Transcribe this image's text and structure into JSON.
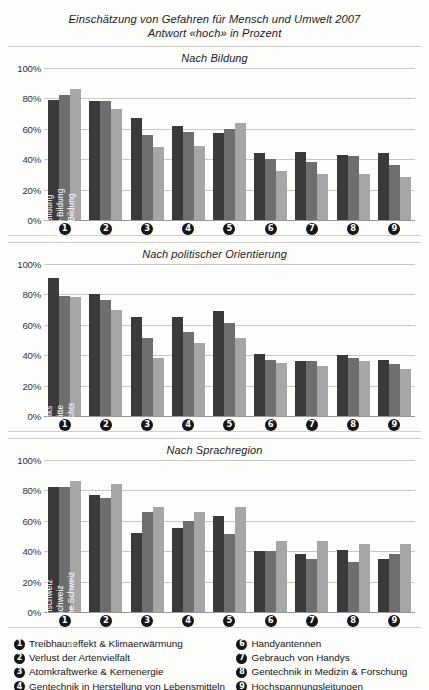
{
  "header": {
    "title_line1": "Einschätzung von Gefahren für Mensch und Umwelt 2007",
    "title_line2": "Antwort «hoch» in Prozent"
  },
  "axis": {
    "ticks": [
      "100%",
      "80%",
      "60%",
      "40%",
      "20%",
      "0%"
    ],
    "categories": [
      "1",
      "2",
      "3",
      "4",
      "5",
      "6",
      "7",
      "8",
      "9"
    ]
  },
  "colors": {
    "series1": "#3a3a3a",
    "series2": "#6e6e6e",
    "series3": "#a6a6a6",
    "grid": "#c9c7c3",
    "background": "#fdfdfc"
  },
  "footnotes": {
    "left": [
      {
        "num": "1",
        "text": "Treibhauseffekt & Klimaerwärmung"
      },
      {
        "num": "2",
        "text": "Verlust der Artenvielfalt"
      },
      {
        "num": "3",
        "text": "Atomkraftwerke & Kernenergie"
      },
      {
        "num": "4",
        "text": "Gentechnik in Herstellung von Lebensmitteln"
      },
      {
        "num": "5",
        "text": "Umweltbelastung & Unfälle durch Autoverkehr"
      }
    ],
    "right": [
      {
        "num": "6",
        "text": "Handyantennen"
      },
      {
        "num": "7",
        "text": "Gebrauch von Handys"
      },
      {
        "num": "8",
        "text": "Gentechnik in Medizin & Forschung"
      },
      {
        "num": "9",
        "text": "Hochspannungsleitungen"
      }
    ]
  },
  "chart_data": [
    {
      "type": "bar",
      "title": "Nach Bildung",
      "xlabel": "",
      "ylabel": "",
      "ylim": [
        0,
        100
      ],
      "grid": true,
      "legend_position": "in-bars-group1",
      "categories": [
        "1",
        "2",
        "3",
        "4",
        "5",
        "6",
        "7",
        "8",
        "9"
      ],
      "series": [
        {
          "name": "tiefe Bildung",
          "values": [
            79,
            78,
            67,
            62,
            57,
            44,
            45,
            43,
            44
          ]
        },
        {
          "name": "mittlere Bildung",
          "values": [
            82,
            78,
            56,
            58,
            60,
            40,
            38,
            42,
            36
          ]
        },
        {
          "name": "hohe Bildung",
          "values": [
            86,
            73,
            48,
            49,
            64,
            32,
            30,
            30,
            28
          ]
        }
      ]
    },
    {
      "type": "bar",
      "title": "Nach politischer Orientierung",
      "xlabel": "",
      "ylabel": "",
      "ylim": [
        0,
        100
      ],
      "grid": true,
      "legend_position": "in-bars-group1",
      "categories": [
        "1",
        "2",
        "3",
        "4",
        "5",
        "6",
        "7",
        "8",
        "9"
      ],
      "series": [
        {
          "name": "links",
          "values": [
            91,
            80,
            65,
            65,
            69,
            41,
            36,
            40,
            37
          ]
        },
        {
          "name": "mitte",
          "values": [
            79,
            76,
            51,
            55,
            61,
            37,
            36,
            38,
            34
          ]
        },
        {
          "name": "rechts",
          "values": [
            78,
            70,
            38,
            48,
            51,
            35,
            33,
            36,
            31
          ]
        }
      ]
    },
    {
      "type": "bar",
      "title": "Nach Sprachregion",
      "xlabel": "",
      "ylabel": "",
      "ylim": [
        0,
        100
      ],
      "grid": true,
      "legend_position": "in-bars-group1",
      "categories": [
        "1",
        "2",
        "3",
        "4",
        "5",
        "6",
        "7",
        "8",
        "9"
      ],
      "series": [
        {
          "name": "Deutschschweiz",
          "values": [
            82,
            77,
            52,
            55,
            63,
            40,
            38,
            41,
            35
          ]
        },
        {
          "name": "Westschweiz",
          "values": [
            82,
            75,
            66,
            60,
            51,
            40,
            35,
            33,
            38
          ]
        },
        {
          "name": "Italienische Schweiz",
          "values": [
            86,
            84,
            69,
            66,
            69,
            47,
            47,
            45,
            45
          ]
        }
      ]
    }
  ]
}
